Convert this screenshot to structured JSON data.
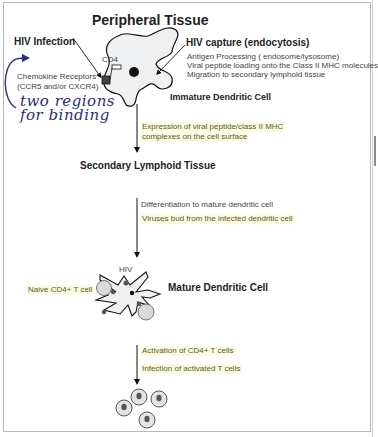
{
  "title": "Peripheral Tissue",
  "stage1": {
    "hiv_infection_label": "HIV Infection",
    "cd4_label": "CD4",
    "chemokine_label_line1": "Chemokine Receptors",
    "chemokine_label_line2": "(CCR5 and/or CXCR4)",
    "handwritten_note_line1": "two regions",
    "handwritten_note_line2": "for binding",
    "capture_label": "HIV capture (endocytosis)",
    "capture_steps": [
      "Antigen Processing ( endosome/lysosome)",
      "Viral peptide loading onto the Class II MHC molecules",
      "Migration to secondary lymphoid tissue"
    ],
    "cell_label": "Immature Dendritic Cell"
  },
  "transition1": {
    "line1": "Expression of viral peptide/class II MHC",
    "line2": "complexes on the cell surface"
  },
  "stage2": {
    "title": "Secondary Lymphoid Tissue"
  },
  "transition2": {
    "line1": "Differentiation to mature dendritic cell",
    "line2": "Viruses bud from the infected dendritic cell"
  },
  "stage3": {
    "hiv_label": "HIV",
    "naive_label": "Naive CD4+ T cell",
    "cell_label": "Mature Dendritic Cell"
  },
  "transition3": {
    "line1": "Activation of CD4+ T cells",
    "line2": "Infection of activated T cells"
  },
  "colors": {
    "highlight_bg": "#fbfbe4",
    "highlight_text": "#5c5a1a",
    "handwriting": "#2d2f7a",
    "cell_fill": "#eef0f2",
    "outline": "#111111"
  }
}
